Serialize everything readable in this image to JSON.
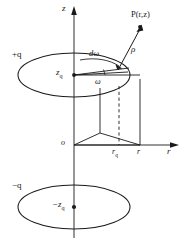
{
  "figure": {
    "kind": "physics-geometry-diagram",
    "background_color": "#ffffff",
    "stroke_color": "#1a1a1a"
  },
  "axes": {
    "vertical": {
      "name": "z-axis",
      "label": "z",
      "arrow": "up"
    },
    "horizontal": {
      "name": "r-axis",
      "label": "r",
      "arrow": "right"
    },
    "origin_label": "o"
  },
  "labels": {
    "source_charge": "+q",
    "image_charge": "−q",
    "source_height": "z",
    "source_height_sub": "q",
    "image_height": "−z",
    "image_height_sub": "q",
    "field_point": "P(r,z)",
    "distance": "ρ",
    "angle": "ω",
    "angle_element": "dω",
    "tick_rq": "r",
    "tick_rq_sub": "q",
    "tick_r": "r"
  },
  "geometry": {
    "upper_ellipse": {
      "name": "source-charge-ring",
      "cx": 74,
      "cy": 75,
      "rx": 56,
      "ry": 22
    },
    "lower_ellipse": {
      "name": "image-charge-ring",
      "cx": 74,
      "cy": 207,
      "rx": 56,
      "ry": 22
    },
    "ring_center_point": {
      "x": 74,
      "y": 75
    },
    "image_center_point": {
      "x": 74,
      "y": 207
    },
    "field_point_position": {
      "x": 140,
      "y": 30
    },
    "rq_tick_position": {
      "x": 119,
      "y": 145
    },
    "r_tick_position": {
      "x": 140,
      "y": 145
    },
    "origin_position": {
      "x": 62,
      "y": 145
    },
    "dashed_line": {
      "name": "rq-projection",
      "from_y": 88,
      "to_y": 145
    }
  }
}
